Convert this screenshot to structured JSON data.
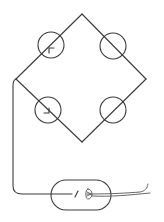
{
  "diagram": {
    "type": "circuit-schematic",
    "colors": {
      "background": "#ffffff",
      "line": "#3a3a3a"
    },
    "bridge": {
      "vertices": {
        "top": [
          82,
          14
        ],
        "right": [
          146,
          79
        ],
        "bottom": [
          82,
          142
        ],
        "left": [
          16,
          79
        ]
      },
      "elements": [
        {
          "id": "top-left",
          "shape": "circle",
          "center": [
            51,
            45
          ],
          "radius": 13,
          "arrow": "pointing-down-left-to-up-right"
        },
        {
          "id": "top-right",
          "shape": "circle",
          "center": [
            113,
            46
          ],
          "radius": 13,
          "arrow": "none"
        },
        {
          "id": "bottom-left",
          "shape": "circle",
          "center": [
            48,
            110
          ],
          "radius": 13,
          "arrow": "pointing-up-left-to-down-right"
        },
        {
          "id": "bottom-right",
          "shape": "circle",
          "center": [
            113,
            110
          ],
          "radius": 13,
          "arrow": "none"
        }
      ]
    },
    "capsule": {
      "shape": "rounded-rectangle",
      "bounds": [
        51,
        180,
        111,
        210
      ],
      "contents": [
        "switch-slash",
        "lamp-filament"
      ]
    },
    "lead_wire": {
      "exits": "right",
      "end": [
        148,
        188
      ]
    }
  }
}
